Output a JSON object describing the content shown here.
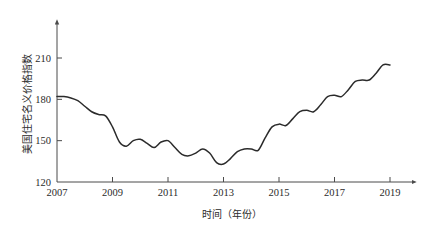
{
  "chart_data": {
    "type": "line",
    "title": "",
    "xlabel": "时间（年份）",
    "ylabel": "美国住宅名义价格指数",
    "xlim": [
      2007,
      2019.2
    ],
    "ylim": [
      120,
      222
    ],
    "grid": false,
    "legend": "none",
    "xticks": [
      "2007",
      "2009",
      "2011",
      "2013",
      "2015",
      "2017",
      "2019"
    ],
    "xtick_values": [
      2007,
      2009,
      2011,
      2013,
      2015,
      2017,
      2019
    ],
    "yticks": [
      "120",
      "150",
      "180",
      "210"
    ],
    "ytick_values": [
      120,
      150,
      180,
      210
    ],
    "series": [
      {
        "name": "美国住宅名义价格指数",
        "color": "#2b2b2b",
        "x": [
          2007.0,
          2007.25,
          2007.5,
          2007.75,
          2008.0,
          2008.25,
          2008.5,
          2008.75,
          2009.0,
          2009.25,
          2009.5,
          2009.75,
          2010.0,
          2010.25,
          2010.5,
          2010.75,
          2011.0,
          2011.25,
          2011.5,
          2011.75,
          2012.0,
          2012.25,
          2012.5,
          2012.75,
          2013.0,
          2013.25,
          2013.5,
          2013.75,
          2014.0,
          2014.25,
          2014.5,
          2014.75,
          2015.0,
          2015.25,
          2015.5,
          2015.75,
          2016.0,
          2016.25,
          2016.5,
          2016.75,
          2017.0,
          2017.25,
          2017.5,
          2017.75,
          2018.0,
          2018.25,
          2018.5,
          2018.75,
          2019.0
        ],
        "y": [
          182,
          182,
          181,
          179,
          175,
          171,
          169,
          168,
          160,
          149,
          146,
          150,
          151,
          148,
          145,
          149,
          150,
          145,
          140,
          139,
          141,
          144,
          141,
          134,
          133,
          137,
          142,
          144,
          144,
          143,
          152,
          160,
          162,
          161,
          166,
          171,
          172,
          171,
          176,
          182,
          183,
          182,
          187,
          193,
          194,
          194,
          199,
          205,
          205
        ]
      }
    ]
  },
  "axis": {
    "x_arrow": "x-axis-arrow",
    "y_arrow": "y-axis-arrow"
  }
}
